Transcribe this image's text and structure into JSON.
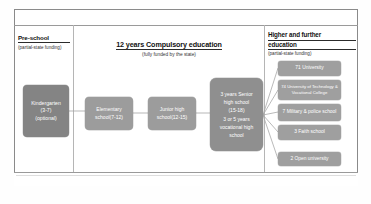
{
  "diagram": {
    "title_sections": {
      "pre_school": {
        "heading": "Pre-school",
        "subheading": "(partial-state funding)"
      },
      "compulsory": {
        "heading": "12 years Compulsory education",
        "subheading": "(fully funded by the state)"
      },
      "higher": {
        "heading_line1": "Higher and further",
        "heading_line2": "education",
        "subheading": "(partial-state funding)"
      }
    },
    "flow_boxes": [
      {
        "id": "kindergarten",
        "lines": [
          "Kindergarten",
          "(3-7)",
          "(optional)"
        ]
      },
      {
        "id": "elementary",
        "lines": [
          "Elementary",
          "school(7-12)"
        ]
      },
      {
        "id": "junior-high",
        "lines": [
          "Junior high",
          "school(12-15)"
        ]
      },
      {
        "id": "senior-high",
        "lines": [
          "3 years Senior",
          "high school",
          "(15-18)",
          "3 or 5 years",
          "vocational high",
          "school"
        ]
      }
    ],
    "higher_education_boxes": [
      {
        "count": "71",
        "label": "71 University"
      },
      {
        "count": "74",
        "label": "74 University of Technology & Vocational College"
      },
      {
        "count": "7",
        "label": "7 Military & police school"
      },
      {
        "count": "3",
        "label": "3 Faith school"
      },
      {
        "count": "2",
        "label": "2 Open university"
      }
    ],
    "colors": {
      "frame": "#8a8a8a",
      "divider": "#b5b5b5",
      "box_dark": "#848484",
      "box_mid": "#8f8f8f",
      "box_light": "#9c9c9c",
      "box_right": "#9f9f9f",
      "connector": "#a5a5a5",
      "text_on_box": "#ffffff",
      "heading_text": "#111111"
    }
  }
}
